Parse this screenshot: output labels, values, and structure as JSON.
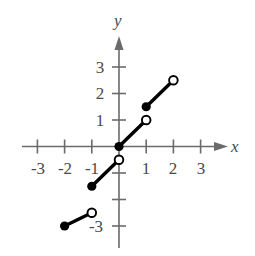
{
  "chart_data": {
    "type": "line",
    "title": "",
    "subtitle": "",
    "xlabel": "x",
    "ylabel": "y",
    "xlim": [
      -3.8,
      3.8
    ],
    "ylim": [
      -3.8,
      3.8
    ],
    "grid": false,
    "legend": null,
    "annotations": [],
    "x_ticks": [
      -3,
      -2,
      -1,
      1,
      2,
      3
    ],
    "x_tick_labels": [
      "-3",
      "-2",
      "-1",
      "1",
      "2",
      "3"
    ],
    "y_ticks": [
      -3,
      -2,
      -1,
      1,
      2,
      3
    ],
    "y_tick_labels": [
      "-3",
      "",
      "",
      "1",
      "2",
      "3"
    ],
    "series": [
      {
        "name": "segment-1",
        "x": [
          -2,
          -1
        ],
        "y": [
          -3,
          -2.5
        ],
        "start_marker": "filled-circle",
        "end_marker": "open-circle"
      },
      {
        "name": "segment-2",
        "x": [
          -1,
          0
        ],
        "y": [
          -1.5,
          -0.5
        ],
        "start_marker": "filled-circle",
        "end_marker": "open-circle"
      },
      {
        "name": "segment-3",
        "x": [
          0,
          1
        ],
        "y": [
          0,
          1
        ],
        "start_marker": "filled-circle",
        "end_marker": "open-circle"
      },
      {
        "name": "segment-4",
        "x": [
          1,
          2
        ],
        "y": [
          1.5,
          2.5
        ],
        "start_marker": "filled-circle",
        "end_marker": "open-circle"
      }
    ],
    "colors": {
      "curve": "#000000",
      "axis": "#6b6b6b",
      "text": "#4a4a4a",
      "background": "#ffffff"
    }
  },
  "labels": {
    "x_axis": "x",
    "y_axis": "y",
    "x_neg3": "-3",
    "x_neg2": "-2",
    "x_neg1": "-1",
    "x_pos1": "1",
    "x_pos2": "2",
    "x_pos3": "3",
    "y_pos1": "1",
    "y_pos2": "2",
    "y_pos3": "3",
    "y_neg3": "-3"
  }
}
